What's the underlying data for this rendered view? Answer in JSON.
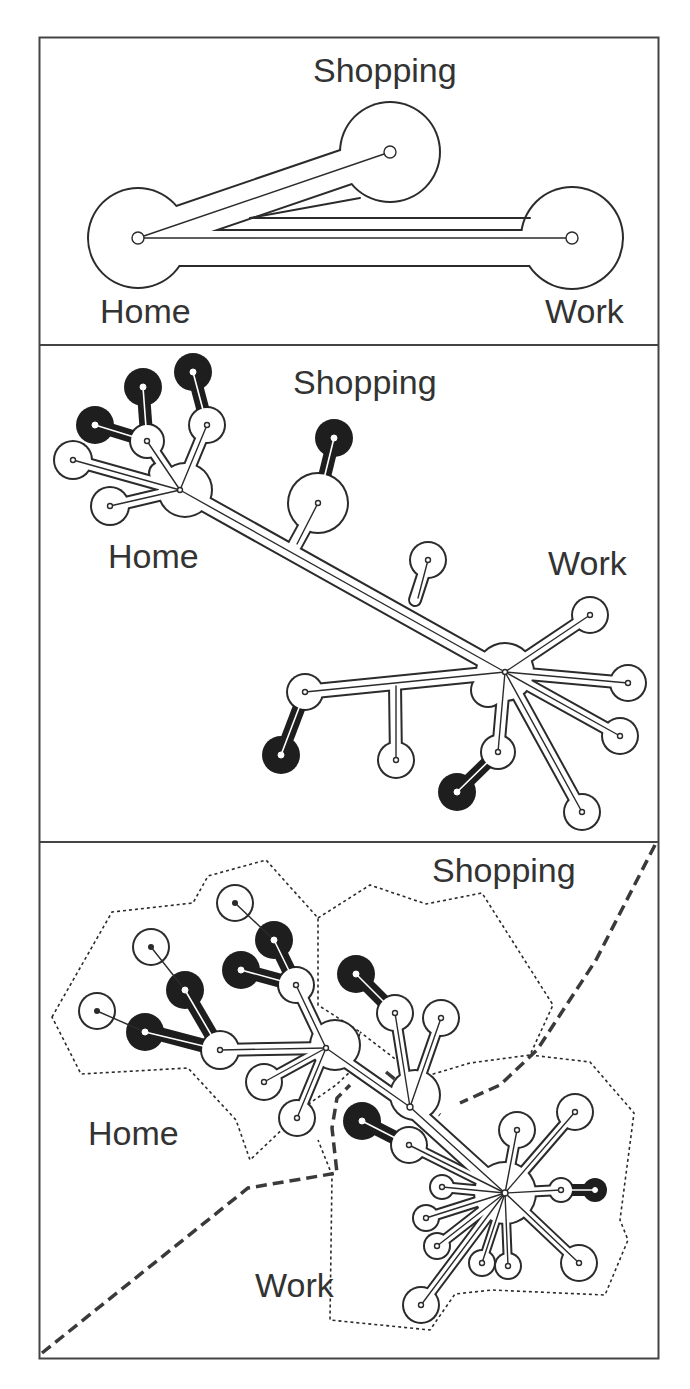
{
  "figure": {
    "border_color": "#444444",
    "ink_color": "#2b2b2b",
    "filled_node_color": "#1e1e1e",
    "panels": [
      {
        "id": "panel-1",
        "labels": [
          {
            "text": "Shopping",
            "x": 313,
            "y": 82
          },
          {
            "text": "Home",
            "x": 100,
            "y": 323
          },
          {
            "text": "Work",
            "x": 545,
            "y": 323
          }
        ]
      },
      {
        "id": "panel-2",
        "labels": [
          {
            "text": "Shopping",
            "x": 293,
            "y": 394
          },
          {
            "text": "Home",
            "x": 108,
            "y": 568
          },
          {
            "text": "Work",
            "x": 548,
            "y": 575
          }
        ]
      },
      {
        "id": "panel-3",
        "labels": [
          {
            "text": "Shopping",
            "x": 432,
            "y": 882
          },
          {
            "text": "Home",
            "x": 88,
            "y": 1145
          },
          {
            "text": "Work",
            "x": 255,
            "y": 1297
          }
        ]
      }
    ]
  }
}
